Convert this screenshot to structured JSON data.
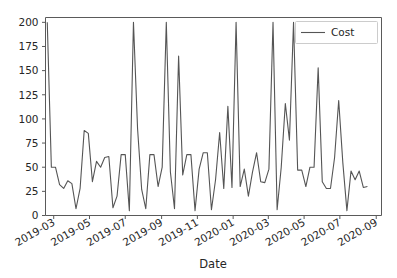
{
  "chart_data": {
    "type": "line",
    "title": "",
    "xlabel": "Date",
    "ylabel": "",
    "ylim": [
      0,
      205
    ],
    "xlim": [
      "2019-02-15",
      "2020-09-10"
    ],
    "grid": false,
    "legend_position": "upper right",
    "line_color": "#555555",
    "y_ticks": [
      0,
      25,
      50,
      75,
      100,
      125,
      150,
      175,
      200
    ],
    "y_tick_labels": [
      "0",
      "25",
      "50",
      "75",
      "100",
      "125",
      "150",
      "175",
      "200"
    ],
    "x_ticks": [
      "2019-03",
      "2019-05",
      "2019-07",
      "2019-09",
      "2019-11",
      "2020-01",
      "2020-03",
      "2020-05",
      "2020-07",
      "2020-09"
    ],
    "x_tick_labels": [
      "2019-03",
      "2019-05",
      "2019-07",
      "2019-09",
      "2019-11",
      "2020-01",
      "2020-03",
      "2020-05",
      "2020-07",
      "2020-09"
    ],
    "series": [
      {
        "name": "Cost",
        "color": "#555555",
        "x": [
          "2019-02-18",
          "2019-02-25",
          "2019-03-04",
          "2019-03-11",
          "2019-03-18",
          "2019-03-25",
          "2019-04-01",
          "2019-04-08",
          "2019-04-15",
          "2019-04-22",
          "2019-04-29",
          "2019-05-06",
          "2019-05-13",
          "2019-05-20",
          "2019-05-27",
          "2019-06-03",
          "2019-06-10",
          "2019-06-17",
          "2019-06-24",
          "2019-07-01",
          "2019-07-08",
          "2019-07-15",
          "2019-07-22",
          "2019-07-29",
          "2019-08-05",
          "2019-08-12",
          "2019-08-19",
          "2019-08-26",
          "2019-09-02",
          "2019-09-09",
          "2019-09-16",
          "2019-09-23",
          "2019-09-30",
          "2019-10-07",
          "2019-10-14",
          "2019-10-21",
          "2019-10-28",
          "2019-11-04",
          "2019-11-11",
          "2019-11-18",
          "2019-11-25",
          "2019-12-02",
          "2019-12-09",
          "2019-12-16",
          "2019-12-23",
          "2019-12-30",
          "2020-01-06",
          "2020-01-13",
          "2020-01-20",
          "2020-01-27",
          "2020-02-03",
          "2020-02-10",
          "2020-02-17",
          "2020-02-24",
          "2020-03-02",
          "2020-03-09",
          "2020-03-16",
          "2020-03-23",
          "2020-03-30",
          "2020-04-06",
          "2020-04-13",
          "2020-04-20",
          "2020-04-27",
          "2020-05-04",
          "2020-05-11",
          "2020-05-18",
          "2020-05-25",
          "2020-06-01",
          "2020-06-08",
          "2020-06-15",
          "2020-06-22",
          "2020-06-29",
          "2020-07-06",
          "2020-07-13",
          "2020-07-20",
          "2020-07-27",
          "2020-08-03",
          "2020-08-10",
          "2020-08-17"
        ],
        "values": [
          200,
          50,
          50,
          32,
          28,
          36,
          33,
          7,
          28,
          88,
          85,
          35,
          56,
          50,
          60,
          61,
          8,
          20,
          63,
          63,
          5,
          200,
          90,
          27,
          7,
          63,
          63,
          30,
          50,
          200,
          45,
          7,
          165,
          42,
          63,
          63,
          5,
          48,
          65,
          65,
          6,
          37,
          86,
          28,
          113,
          29,
          200,
          30,
          48,
          20,
          45,
          65,
          35,
          34,
          48,
          200,
          6,
          50,
          116,
          78,
          200,
          47,
          47,
          30,
          50,
          50,
          153,
          35,
          28,
          28,
          60,
          119,
          55,
          5,
          46,
          37,
          46,
          29,
          30
        ]
      }
    ]
  },
  "legend": {
    "entries": [
      {
        "label": "Cost"
      }
    ]
  },
  "axes": {
    "xlabel": "Date",
    "ylabel": ""
  }
}
